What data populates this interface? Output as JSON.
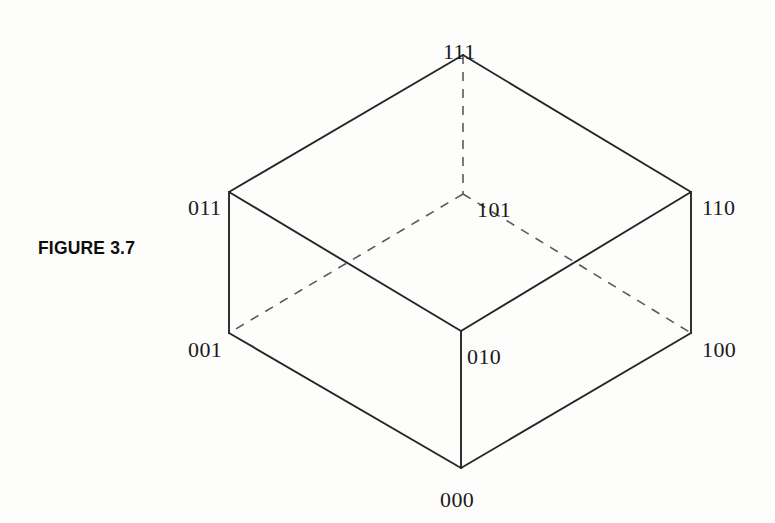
{
  "figure": {
    "caption": "FIGURE  3.7",
    "caption_x": 38,
    "caption_y": 237,
    "background_color": "#fdfdfc",
    "line_color": "#262626",
    "dash_color": "#5a5a5a"
  },
  "diagram": {
    "type": "isometric-cube",
    "vertices": [
      {
        "id": "v111",
        "label": "111",
        "x": 463,
        "y": 55,
        "label_x": 443,
        "label_y": 43,
        "hidden": false
      },
      {
        "id": "v011",
        "label": "011",
        "x": 229,
        "y": 192,
        "label_x": 188,
        "label_y": 199,
        "hidden": false
      },
      {
        "id": "v110",
        "label": "110",
        "x": 691,
        "y": 192,
        "label_x": 702,
        "label_y": 199,
        "hidden": false
      },
      {
        "id": "v101",
        "label": "101",
        "x": 463,
        "y": 194,
        "label_x": 477,
        "label_y": 201,
        "hidden": true
      },
      {
        "id": "v001",
        "label": "001",
        "x": 229,
        "y": 333,
        "label_x": 188,
        "label_y": 341,
        "hidden": false
      },
      {
        "id": "v100",
        "label": "100",
        "x": 691,
        "y": 333,
        "label_x": 702,
        "label_y": 341,
        "hidden": false
      },
      {
        "id": "v010",
        "label": "010",
        "x": 461,
        "y": 331,
        "label_x": 467,
        "label_y": 348,
        "hidden": false
      },
      {
        "id": "v000",
        "label": "000",
        "x": 461,
        "y": 468,
        "label_x": 440,
        "label_y": 491,
        "hidden": false
      }
    ],
    "edges_solid": [
      {
        "from": "v111",
        "to": "v011"
      },
      {
        "from": "v111",
        "to": "v110"
      },
      {
        "from": "v011",
        "to": "v010"
      },
      {
        "from": "v110",
        "to": "v010"
      },
      {
        "from": "v011",
        "to": "v001"
      },
      {
        "from": "v110",
        "to": "v100"
      },
      {
        "from": "v010",
        "to": "v000"
      },
      {
        "from": "v001",
        "to": "v000"
      },
      {
        "from": "v100",
        "to": "v000"
      }
    ],
    "edges_dashed": [
      {
        "from": "v111",
        "to": "v101"
      },
      {
        "from": "v101",
        "to": "v001"
      },
      {
        "from": "v101",
        "to": "v100"
      }
    ]
  }
}
